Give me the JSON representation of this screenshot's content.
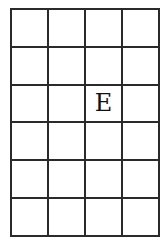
{
  "grid": {
    "rows": 6,
    "columns": 4,
    "line_color": "#2a2a2a",
    "cells": [
      [
        "",
        "",
        "",
        ""
      ],
      [
        "",
        "",
        "",
        ""
      ],
      [
        "",
        "",
        "E",
        ""
      ],
      [
        "",
        "",
        "",
        ""
      ],
      [
        "",
        "",
        "",
        ""
      ],
      [
        "",
        "",
        "",
        ""
      ]
    ]
  }
}
